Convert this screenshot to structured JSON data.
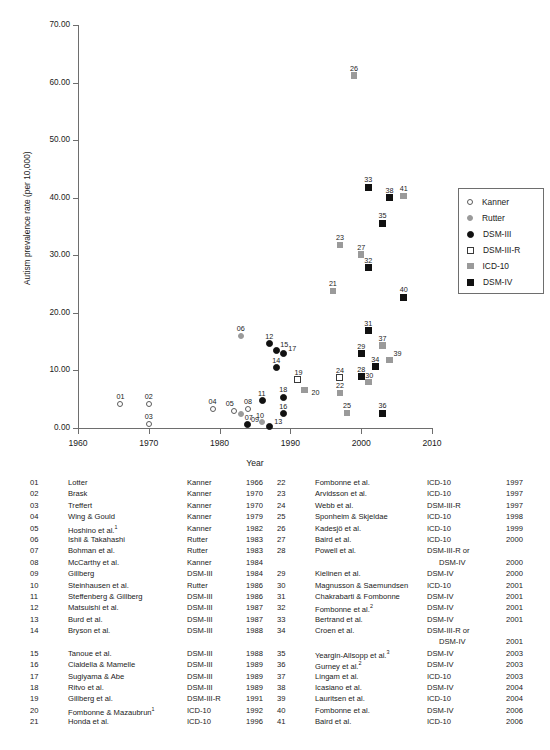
{
  "chart_data": {
    "type": "scatter",
    "title": "",
    "xlabel": "Year",
    "ylabel": "Autism prevalence rate (per 10,000)",
    "xlim": [
      1960,
      2010
    ],
    "ylim": [
      0.0,
      70.0
    ],
    "xticks": [
      "1960",
      "1970",
      "1980",
      "1990",
      "2000",
      "2010"
    ],
    "yticks": [
      "0.00",
      "10.00",
      "20.00",
      "30.00",
      "40.00",
      "50.00",
      "60.00",
      "70.00"
    ],
    "grid": false,
    "legend_position": "right",
    "series": [
      {
        "name": "Kanner",
        "marker": "open-circle",
        "color": "#ffffff"
      },
      {
        "name": "Rutter",
        "marker": "grey-circle",
        "color": "#9a9a9a"
      },
      {
        "name": "DSM-III",
        "marker": "black-circle",
        "color": "#111111"
      },
      {
        "name": "DSM-III-R",
        "marker": "open-square",
        "color": "#ffffff"
      },
      {
        "name": "ICD-10",
        "marker": "grey-square",
        "color": "#9a9a9a"
      },
      {
        "name": "DSM-IV",
        "marker": "black-square",
        "color": "#111111"
      }
    ],
    "points": [
      {
        "id": "01",
        "year": 1966,
        "rate": 4.1,
        "series": "Kanner",
        "lx": -4,
        "ly": -12
      },
      {
        "id": "02",
        "year": 1970,
        "rate": 4.1,
        "series": "Kanner",
        "lx": -4,
        "ly": -12
      },
      {
        "id": "03",
        "year": 1970,
        "rate": 0.7,
        "series": "Kanner",
        "lx": -4,
        "ly": -12
      },
      {
        "id": "04",
        "year": 1979,
        "rate": 3.3,
        "series": "Kanner",
        "lx": -4,
        "ly": -12
      },
      {
        "id": "05",
        "year": 1982,
        "rate": 2.9,
        "series": "Kanner",
        "lx": -8,
        "ly": -12
      },
      {
        "id": "06",
        "year": 1983,
        "rate": 16.0,
        "series": "Rutter",
        "lx": -4,
        "ly": -12
      },
      {
        "id": "07",
        "year": 1983,
        "rate": 2.4,
        "series": "Rutter",
        "lx": 4,
        "ly": -1
      },
      {
        "id": "08",
        "year": 1984,
        "rate": 3.3,
        "series": "Kanner",
        "lx": -4,
        "ly": -12
      },
      {
        "id": "09",
        "year": 1984,
        "rate": 0.6,
        "series": "DSM-III",
        "lx": 3,
        "ly": -10
      },
      {
        "id": "10",
        "year": 1986,
        "rate": 1.1,
        "series": "Rutter",
        "lx": -6,
        "ly": -11
      },
      {
        "id": "11",
        "year": 1986,
        "rate": 4.7,
        "series": "DSM-III",
        "lx": -4,
        "ly": -12
      },
      {
        "id": "12",
        "year": 1987,
        "rate": 14.6,
        "series": "DSM-III",
        "lx": -4,
        "ly": -12
      },
      {
        "id": "13",
        "year": 1987,
        "rate": 0.2,
        "series": "DSM-III",
        "lx": 5,
        "ly": -10
      },
      {
        "id": "14",
        "year": 1988,
        "rate": 10.5,
        "series": "DSM-III",
        "lx": -4,
        "ly": -12
      },
      {
        "id": "15",
        "year": 1988,
        "rate": 13.5,
        "series": "DSM-III",
        "lx": 4,
        "ly": -10
      },
      {
        "id": "16",
        "year": 1989,
        "rate": 2.5,
        "series": "DSM-III",
        "lx": -4,
        "ly": -12
      },
      {
        "id": "17",
        "year": 1989,
        "rate": 12.9,
        "series": "DSM-III",
        "lx": 5,
        "ly": -10
      },
      {
        "id": "18",
        "year": 1989,
        "rate": 5.3,
        "series": "DSM-III",
        "lx": -4,
        "ly": -12
      },
      {
        "id": "19",
        "year": 1991,
        "rate": 8.4,
        "series": "DSM-III-R",
        "lx": -3,
        "ly": -12
      },
      {
        "id": "20",
        "year": 1992,
        "rate": 6.6,
        "series": "ICD-10",
        "lx": 7,
        "ly": -2
      },
      {
        "id": "21",
        "year": 1996,
        "rate": 23.8,
        "series": "ICD-10",
        "lx": -4,
        "ly": -12
      },
      {
        "id": "22",
        "year": 1997,
        "rate": 6.1,
        "series": "ICD-10",
        "lx": -4,
        "ly": -12
      },
      {
        "id": "23",
        "year": 1997,
        "rate": 31.8,
        "series": "ICD-10",
        "lx": -4,
        "ly": -12
      },
      {
        "id": "24",
        "year": 1997,
        "rate": 8.7,
        "series": "DSM-III-R",
        "lx": -4,
        "ly": -12
      },
      {
        "id": "25",
        "year": 1998,
        "rate": 2.6,
        "series": "ICD-10",
        "lx": -4,
        "ly": -12
      },
      {
        "id": "26",
        "year": 1999,
        "rate": 61.2,
        "series": "ICD-10",
        "lx": -4,
        "ly": -12
      },
      {
        "id": "27",
        "year": 2000,
        "rate": 30.1,
        "series": "ICD-10",
        "lx": -4,
        "ly": -12
      },
      {
        "id": "28",
        "year": 2000,
        "rate": 8.9,
        "series": "DSM-IV",
        "lx": -4,
        "ly": -12
      },
      {
        "id": "29",
        "year": 2000,
        "rate": 12.9,
        "series": "DSM-IV",
        "lx": -4,
        "ly": -12
      },
      {
        "id": "30",
        "year": 2001,
        "rate": 8.0,
        "series": "ICD-10",
        "lx": -3,
        "ly": -11
      },
      {
        "id": "31",
        "year": 2001,
        "rate": 16.9,
        "series": "DSM-IV",
        "lx": -4,
        "ly": -12
      },
      {
        "id": "32",
        "year": 2001,
        "rate": 27.8,
        "series": "DSM-IV",
        "lx": -4,
        "ly": -12
      },
      {
        "id": "33",
        "year": 2001,
        "rate": 41.8,
        "series": "DSM-IV",
        "lx": -4,
        "ly": -12
      },
      {
        "id": "34",
        "year": 2002,
        "rate": 10.6,
        "series": "DSM-IV",
        "lx": -4,
        "ly": -12
      },
      {
        "id": "35",
        "year": 2003,
        "rate": 35.6,
        "series": "DSM-IV",
        "lx": -4,
        "ly": -12
      },
      {
        "id": "36",
        "year": 2003,
        "rate": 2.6,
        "series": "DSM-IV",
        "lx": -4,
        "ly": -12
      },
      {
        "id": "37",
        "year": 2003,
        "rate": 14.3,
        "series": "ICD-10",
        "lx": -4,
        "ly": -12
      },
      {
        "id": "38",
        "year": 2004,
        "rate": 40.0,
        "series": "DSM-IV",
        "lx": -4,
        "ly": -12
      },
      {
        "id": "39",
        "year": 2004,
        "rate": 11.8,
        "series": "ICD-10",
        "lx": 4,
        "ly": -11
      },
      {
        "id": "40",
        "year": 2006,
        "rate": 22.7,
        "series": "DSM-IV",
        "lx": -4,
        "ly": -12
      },
      {
        "id": "41",
        "year": 2006,
        "rate": 40.3,
        "series": "ICD-10",
        "lx": -4,
        "ly": -12
      }
    ]
  },
  "legend": {
    "items": [
      {
        "label": "Kanner",
        "marker": "open-circle"
      },
      {
        "label": "Rutter",
        "marker": "grey-circle"
      },
      {
        "label": "DSM-III",
        "marker": "black-circle"
      },
      {
        "label": "DSM-III-R",
        "marker": "open-square"
      },
      {
        "label": "ICD-10",
        "marker": "grey-square"
      },
      {
        "label": "DSM-IV",
        "marker": "black-square"
      }
    ]
  },
  "references": {
    "left": [
      {
        "num": "01",
        "name": "Lotter",
        "sup": "",
        "criteria": "Kanner",
        "year": "1966"
      },
      {
        "num": "02",
        "name": "Brask",
        "sup": "",
        "criteria": "Kanner",
        "year": "1970"
      },
      {
        "num": "03",
        "name": "Treffert",
        "sup": "",
        "criteria": "Kanner",
        "year": "1970"
      },
      {
        "num": "04",
        "name": "Wing & Gould",
        "sup": "",
        "criteria": "Kanner",
        "year": "1979"
      },
      {
        "num": "05",
        "name": "Hoshino et al.",
        "sup": "1",
        "criteria": "Kanner",
        "year": "1982"
      },
      {
        "num": "06",
        "name": "Ishii & Takahashi",
        "sup": "",
        "criteria": "Rutter",
        "year": "1983"
      },
      {
        "num": "07",
        "name": "Bohman et al.",
        "sup": "",
        "criteria": "Rutter",
        "year": "1983"
      },
      {
        "num": "08",
        "name": "McCarthy et al.",
        "sup": "",
        "criteria": "Kanner",
        "year": "1984"
      },
      {
        "num": "09",
        "name": "Gillberg",
        "sup": "",
        "criteria": "DSM-III",
        "year": "1984"
      },
      {
        "num": "10",
        "name": "Steinhausen et al.",
        "sup": "",
        "criteria": "Rutter",
        "year": "1986"
      },
      {
        "num": "11",
        "name": "Steffenberg & Gillberg",
        "sup": "",
        "criteria": "DSM-III",
        "year": "1986"
      },
      {
        "num": "12",
        "name": "Matsuishi et al.",
        "sup": "",
        "criteria": "DSM-III",
        "year": "1987"
      },
      {
        "num": "13",
        "name": "Burd et al.",
        "sup": "",
        "criteria": "DSM-III",
        "year": "1987"
      },
      {
        "num": "14",
        "name": "Bryson et al.",
        "sup": "",
        "criteria": "DSM-III",
        "year": "1988"
      },
      {
        "num": "",
        "name": "",
        "sup": "",
        "criteria": "",
        "year": ""
      },
      {
        "num": "15",
        "name": "Tanoue et al.",
        "sup": "",
        "criteria": "DSM-III",
        "year": "1988"
      },
      {
        "num": "16",
        "name": "Cialdella & Mamelle",
        "sup": "",
        "criteria": "DSM-III",
        "year": "1989"
      },
      {
        "num": "17",
        "name": "Sugiyama & Abe",
        "sup": "",
        "criteria": "DSM-III",
        "year": "1989"
      },
      {
        "num": "18",
        "name": "Ritvo et al.",
        "sup": "",
        "criteria": "DSM-III",
        "year": "1989"
      },
      {
        "num": "19",
        "name": "Gillberg et al.",
        "sup": "",
        "criteria": "DSM-III-R",
        "year": "1991"
      },
      {
        "num": "20",
        "name": "Fombonne & Mazaubrun",
        "sup": "1",
        "criteria": "ICD-10",
        "year": "1992"
      },
      {
        "num": "21",
        "name": "Honda et al.",
        "sup": "",
        "criteria": "ICD-10",
        "year": "1996"
      }
    ],
    "right": [
      {
        "num": "22",
        "name": "Fombonne et al.",
        "sup": "",
        "criteria": "ICD-10",
        "year": "1997",
        "indent": false
      },
      {
        "num": "23",
        "name": "Arvidsson et al.",
        "sup": "",
        "criteria": "ICD-10",
        "year": "1997",
        "indent": false
      },
      {
        "num": "24",
        "name": "Webb et al.",
        "sup": "",
        "criteria": "DSM-III-R",
        "year": "1997",
        "indent": false
      },
      {
        "num": "25",
        "name": "Sponheim & Skjeldae",
        "sup": "",
        "criteria": "ICD-10",
        "year": "1998",
        "indent": false
      },
      {
        "num": "26",
        "name": "Kadesjö et al.",
        "sup": "",
        "criteria": "ICD-10",
        "year": "1999",
        "indent": false
      },
      {
        "num": "27",
        "name": "Baird et al.",
        "sup": "",
        "criteria": "ICD-10",
        "year": "2000",
        "indent": false
      },
      {
        "num": "28",
        "name": "Powell et al.",
        "sup": "",
        "criteria": "DSM-III-R or",
        "year": "",
        "indent": false
      },
      {
        "num": "",
        "name": "",
        "sup": "",
        "criteria": "DSM-IV",
        "year": "2000",
        "indent": true
      },
      {
        "num": "29",
        "name": "Kielinen et al.",
        "sup": "",
        "criteria": "DSM-IV",
        "year": "2000",
        "indent": false
      },
      {
        "num": "30",
        "name": "Magnusson & Saemundsen",
        "sup": "",
        "criteria": "ICD-10",
        "year": "2001",
        "indent": false
      },
      {
        "num": "31",
        "name": "Chakrabarti & Fombonne",
        "sup": "",
        "criteria": "DSM-IV",
        "year": "2001",
        "indent": false
      },
      {
        "num": "32",
        "name": "Fombonne et al.",
        "sup": "2",
        "criteria": "DSM-IV",
        "year": "2001",
        "indent": false
      },
      {
        "num": "33",
        "name": "Bertrand et al.",
        "sup": "",
        "criteria": "DSM-IV",
        "year": "2001",
        "indent": false
      },
      {
        "num": "34",
        "name": "Croen et al.",
        "sup": "",
        "criteria": "DSM-III-R or",
        "year": "",
        "indent": false
      },
      {
        "num": "",
        "name": "",
        "sup": "",
        "criteria": "DSM-IV",
        "year": "2001",
        "indent": true
      },
      {
        "num": "35",
        "name": "Yeargin-Allsopp et al.",
        "sup": "3",
        "criteria": "DSM-IV",
        "year": "2003",
        "indent": false
      },
      {
        "num": "36",
        "name": "Gurney et al.",
        "sup": "2",
        "criteria": "DSM-IV",
        "year": "2003",
        "indent": false
      },
      {
        "num": "37",
        "name": "Lingam et al.",
        "sup": "",
        "criteria": "ICD-10",
        "year": "2003",
        "indent": false
      },
      {
        "num": "38",
        "name": "Icasiano et al.",
        "sup": "",
        "criteria": "DSM-IV",
        "year": "2004",
        "indent": false
      },
      {
        "num": "39",
        "name": "Lauritsen et al.",
        "sup": "",
        "criteria": "ICD-10",
        "year": "2004",
        "indent": false
      },
      {
        "num": "40",
        "name": "Fombonne et al.",
        "sup": "",
        "criteria": "DSM-IV",
        "year": "2006",
        "indent": false
      },
      {
        "num": "41",
        "name": "Baird et al.",
        "sup": "",
        "criteria": "ICD-10",
        "year": "2006",
        "indent": false
      }
    ]
  }
}
